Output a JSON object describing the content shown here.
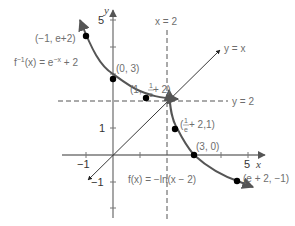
{
  "figure": {
    "type": "function-inverse-graph",
    "axes": {
      "x_label": "x",
      "y_label": "y",
      "x_ticks": [
        {
          "value": -1,
          "label": "−1"
        },
        {
          "value": 1,
          "label": ""
        },
        {
          "value": 2,
          "label": ""
        },
        {
          "value": 3,
          "label": ""
        },
        {
          "value": 4,
          "label": ""
        },
        {
          "value": 5,
          "label": "5"
        }
      ],
      "y_ticks": [
        {
          "value": 5,
          "label": "5"
        },
        {
          "value": 4,
          "label": ""
        },
        {
          "value": 3,
          "label": ""
        },
        {
          "value": 2,
          "label": ""
        },
        {
          "value": 1,
          "label": "1"
        },
        {
          "value": -1,
          "label": "−1"
        },
        {
          "value": -2,
          "label": ""
        }
      ]
    },
    "lines": {
      "identity": {
        "label": "y = x"
      },
      "horizontal_asymptote": {
        "label": "y = 2"
      },
      "vertical_asymptote": {
        "label": "x = 2"
      }
    },
    "functions": {
      "inverse": {
        "label": "f⁻¹(x) = e⁻ˣ + 2",
        "label_base": "f",
        "label_sup1": "−1",
        "label_mid": "(x) = e",
        "label_sup2": "−x",
        "label_end": " + 2"
      },
      "original": {
        "label": "f(x) = −ln(x − 2)"
      }
    },
    "points": [
      {
        "id": "p1",
        "label": "(−1, e+2)",
        "x": -1,
        "y": 4.718
      },
      {
        "id": "p2",
        "label": "(0, 3)",
        "x": 0,
        "y": 3
      },
      {
        "id": "p3",
        "label_pre": "(1, ",
        "label_frac_num": "1",
        "label_frac_den": "e",
        "label_post": " + 2)",
        "x": 1,
        "y": 2.368
      },
      {
        "id": "p4",
        "label_pre": "(",
        "label_frac_num": "1",
        "label_frac_den": "e",
        "label_post": " + 2,1)",
        "x": 2.368,
        "y": 1
      },
      {
        "id": "p5",
        "label": "(3, 0)",
        "x": 3,
        "y": 0
      },
      {
        "id": "p6",
        "label": "(e + 2, −1)",
        "x": 4.718,
        "y": -1
      }
    ],
    "colors": {
      "axis": "#555555",
      "curve": "#555555",
      "point": "#000000",
      "label": "#6e6e6e",
      "dashed": "#555555"
    }
  }
}
